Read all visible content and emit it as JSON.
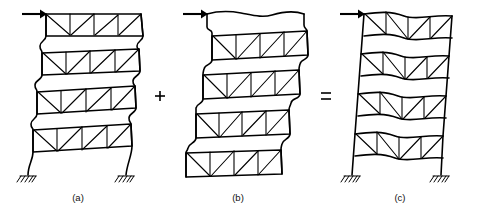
{
  "figure": {
    "background_color": "#ffffff",
    "ink_color": "#000000",
    "width": 482,
    "height": 217,
    "story_count": 4,
    "bay_count": 2
  },
  "panels": [
    {
      "id": "a",
      "caption": "(a)",
      "caption_x": 78,
      "caption_y": 198,
      "load_arrow": {
        "name": "lateral-load-arrow",
        "label": "",
        "direction": "right",
        "x_start": 22,
        "x_end": 46,
        "y": 14
      },
      "has_supports": true,
      "support_type": "fixed",
      "description": "Frame with flexural column curvature and rigid floor trusses"
    },
    {
      "id": "b",
      "caption": "(b)",
      "caption_x": 238,
      "caption_y": 198,
      "load_arrow": {
        "name": "lateral-load-arrow",
        "label": "",
        "direction": "right",
        "x_start": 183,
        "x_end": 207,
        "y": 14
      },
      "has_supports": false,
      "support_type": "none",
      "description": "Frame with shear racking of floor trusses, columns free at base"
    },
    {
      "id": "c",
      "caption": "(c)",
      "caption_x": 400,
      "caption_y": 198,
      "load_arrow": {
        "name": "lateral-load-arrow",
        "label": "",
        "direction": "right",
        "x_start": 340,
        "x_end": 364,
        "y": 14
      },
      "has_supports": true,
      "support_type": "fixed",
      "description": "Combined deformed shape with straight columns and bowed floor trusses"
    }
  ],
  "operators": [
    {
      "name": "plus-operator",
      "symbol": "+",
      "x": 160,
      "y": 96
    },
    {
      "name": "equals-operator",
      "symbol": "=",
      "x": 326,
      "y": 96
    }
  ],
  "geometry": {
    "panel_a": {
      "comment": "Each story band described by its four corner points (left-top, right-top, right-bottom, left-bottom) in page pixels",
      "bands": [
        {
          "lt": [
            46,
            14
          ],
          "rt": [
            141,
            14
          ],
          "rb": [
            143,
            36
          ],
          "lb": [
            46,
            36
          ]
        },
        {
          "lt": [
            42,
            53
          ],
          "rt": [
            139,
            49
          ],
          "rb": [
            140,
            71
          ],
          "lb": [
            42,
            75
          ]
        },
        {
          "lt": [
            37,
            92
          ],
          "rt": [
            135,
            86
          ],
          "rb": [
            136,
            108
          ],
          "lb": [
            37,
            114
          ]
        },
        {
          "lt": [
            33,
            130
          ],
          "rt": [
            131,
            124
          ],
          "rb": [
            132,
            146
          ],
          "lb": [
            33,
            152
          ]
        }
      ],
      "left_column_waypoints": [
        [
          46,
          14
        ],
        [
          46,
          36
        ],
        [
          40,
          45
        ],
        [
          42,
          53
        ],
        [
          42,
          75
        ],
        [
          35,
          84
        ],
        [
          37,
          92
        ],
        [
          37,
          114
        ],
        [
          31,
          122
        ],
        [
          33,
          130
        ],
        [
          33,
          152
        ],
        [
          30,
          162
        ],
        [
          28,
          175
        ]
      ],
      "right_column_waypoints": [
        [
          141,
          14
        ],
        [
          143,
          36
        ],
        [
          137,
          45
        ],
        [
          139,
          49
        ],
        [
          140,
          71
        ],
        [
          133,
          80
        ],
        [
          135,
          86
        ],
        [
          136,
          108
        ],
        [
          129,
          117
        ],
        [
          131,
          124
        ],
        [
          132,
          146
        ],
        [
          128,
          158
        ],
        [
          126,
          175
        ]
      ],
      "supports": [
        {
          "name": "support-base-left",
          "x": 28,
          "y": 175
        },
        {
          "name": "support-base-right",
          "x": 126,
          "y": 175
        }
      ]
    },
    "panel_b": {
      "bands": [
        {
          "lt": [
            212,
            36
          ],
          "rt": [
            307,
            31
          ],
          "rb": [
            308,
            55
          ],
          "lb": [
            212,
            60
          ]
        },
        {
          "lt": [
            203,
            75
          ],
          "rt": [
            299,
            70
          ],
          "rb": [
            300,
            94
          ],
          "lb": [
            203,
            99
          ]
        },
        {
          "lt": [
            196,
            114
          ],
          "rt": [
            289,
            110
          ],
          "rb": [
            290,
            134
          ],
          "lb": [
            196,
            138
          ]
        },
        {
          "lt": [
            186,
            153
          ],
          "rt": [
            281,
            150
          ],
          "rb": [
            282,
            174
          ],
          "lb": [
            186,
            177
          ]
        }
      ],
      "left_column_waypoints": [
        [
          207,
          14
        ],
        [
          207,
          27
        ],
        [
          212,
          32
        ],
        [
          212,
          60
        ],
        [
          206,
          67
        ],
        [
          203,
          75
        ],
        [
          203,
          99
        ],
        [
          197,
          106
        ],
        [
          196,
          114
        ],
        [
          196,
          138
        ],
        [
          189,
          146
        ],
        [
          186,
          153
        ],
        [
          186,
          177
        ]
      ],
      "right_column_waypoints": [
        [
          304,
          14
        ],
        [
          304,
          25
        ],
        [
          307,
          31
        ],
        [
          308,
          55
        ],
        [
          301,
          63
        ],
        [
          299,
          70
        ],
        [
          300,
          94
        ],
        [
          292,
          102
        ],
        [
          289,
          110
        ],
        [
          290,
          134
        ],
        [
          283,
          143
        ],
        [
          281,
          150
        ],
        [
          282,
          174
        ]
      ],
      "top_cap_waypoints": [
        [
          207,
          14
        ],
        [
          240,
          12
        ],
        [
          265,
          17
        ],
        [
          286,
          11
        ],
        [
          304,
          14
        ]
      ],
      "supports": []
    },
    "panel_c": {
      "bands": [
        {
          "lt": [
            364,
            14
          ],
          "rt": [
            452,
            16
          ],
          "rb": [
            452,
            38
          ],
          "lb": [
            364,
            36
          ]
        },
        {
          "lt": [
            361,
            54
          ],
          "rt": [
            449,
            56
          ],
          "rb": [
            449,
            78
          ],
          "lb": [
            361,
            76
          ]
        },
        {
          "lt": [
            358,
            94
          ],
          "rt": [
            446,
            96
          ],
          "rb": [
            446,
            118
          ],
          "lb": [
            358,
            116
          ]
        },
        {
          "lt": [
            355,
            134
          ],
          "rt": [
            443,
            136
          ],
          "rb": [
            443,
            158
          ],
          "lb": [
            355,
            156
          ]
        }
      ],
      "left_column_waypoints": [
        [
          364,
          14
        ],
        [
          361,
          54
        ],
        [
          358,
          94
        ],
        [
          355,
          134
        ],
        [
          352,
          175
        ]
      ],
      "right_column_waypoints": [
        [
          452,
          16
        ],
        [
          449,
          56
        ],
        [
          446,
          96
        ],
        [
          443,
          136
        ],
        [
          441,
          175
        ]
      ],
      "band_bow_amplitude": 4,
      "supports": [
        {
          "name": "support-base-left",
          "x": 352,
          "y": 175
        },
        {
          "name": "support-base-right",
          "x": 441,
          "y": 175
        }
      ]
    }
  },
  "bracing": {
    "pattern": "two-bay warren truss with vertical posts",
    "diagonals_per_bay": 2,
    "verticals_per_bay": 2
  }
}
